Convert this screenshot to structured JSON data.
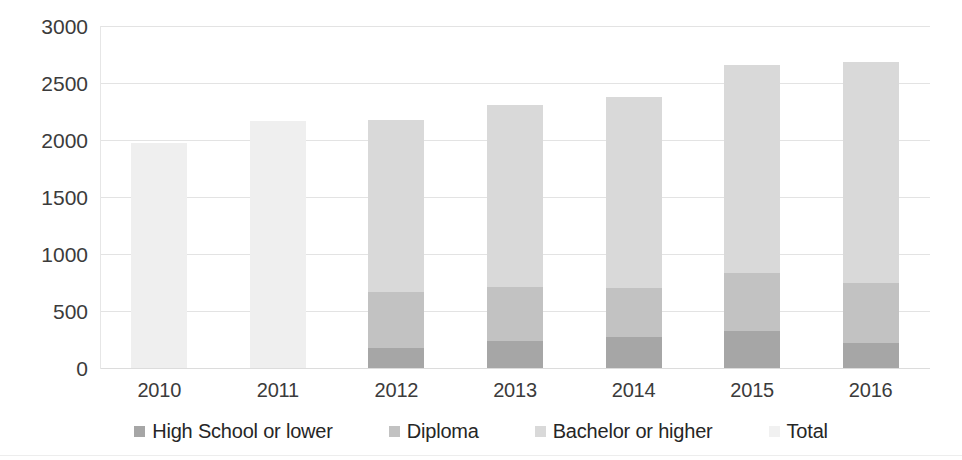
{
  "chart_data": {
    "type": "bar",
    "stacked": true,
    "title": "",
    "subtitle": "",
    "xlabel": "",
    "ylabel": "",
    "categories": [
      "2010",
      "2011",
      "2012",
      "2013",
      "2014",
      "2015",
      "2016"
    ],
    "ylim": [
      0,
      3000
    ],
    "yticks": [
      0,
      500,
      1000,
      1500,
      2000,
      2500,
      3000
    ],
    "ytick_labels": [
      "0",
      "500",
      "1000",
      "1500",
      "2000",
      "2500",
      "3000"
    ],
    "grid": true,
    "grid_axis": "y",
    "legend_position": "bottom",
    "series": [
      {
        "name": "High School or lower",
        "color": "#a6a6a6",
        "values": [
          null,
          null,
          175,
          235,
          270,
          325,
          220
        ]
      },
      {
        "name": "Diploma",
        "color": "#c2c2c2",
        "values": [
          null,
          null,
          495,
          475,
          430,
          510,
          525
        ]
      },
      {
        "name": "Bachelor or higher",
        "color": "#d9d9d9",
        "values": [
          null,
          null,
          1510,
          1600,
          1680,
          1825,
          1940
        ]
      },
      {
        "name": "Total",
        "color": "#efefef",
        "values": [
          1975,
          2170,
          2180,
          2310,
          2380,
          2660,
          2685
        ]
      }
    ],
    "totals": [
      1975,
      2170,
      2180,
      2310,
      2380,
      2660,
      2685
    ]
  },
  "legend": {
    "items": [
      {
        "label": "High School or lower",
        "color": "#a6a6a6"
      },
      {
        "label": "Diploma",
        "color": "#c2c2c2"
      },
      {
        "label": "Bachelor or higher",
        "color": "#d9d9d9"
      },
      {
        "label": "Total",
        "color": "#f1f1f1"
      }
    ]
  },
  "axes": {
    "y": {
      "labels": [
        "3000",
        "2500",
        "2000",
        "1500",
        "1000",
        "500",
        "0"
      ]
    },
    "x": {
      "labels": [
        "2010",
        "2011",
        "2012",
        "2013",
        "2014",
        "2015",
        "2016"
      ]
    }
  },
  "colors": {
    "background": "#ffffff",
    "gridline": "#e3e3e3",
    "tick_text": "#3b3b3b",
    "legend_text": "#262626"
  }
}
